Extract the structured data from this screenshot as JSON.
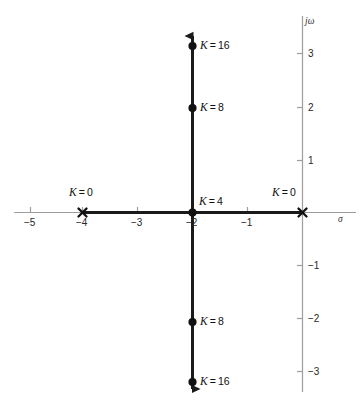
{
  "figure": {
    "type": "root-locus",
    "background": "#ffffff",
    "axis_color": "#9a9a9a",
    "locus_color": "#1a1a1a",
    "width": 364,
    "height": 420
  },
  "axes": {
    "real_axis_label": "σ",
    "imag_axis_label": "jω",
    "real_ticks": [
      "−5",
      "−4",
      "−3",
      "−2",
      "−1"
    ],
    "imag_ticks": [
      "3",
      "2",
      "1",
      "−1",
      "−2",
      "−3"
    ]
  },
  "markers": {
    "pole_left_label": "K = 0",
    "pole_origin_label": "K = 0",
    "breakaway_label": "K = 4",
    "gain8_upper_label": "K = 8",
    "gain8_lower_label": "K = 8",
    "gain16_upper_label": "K = 16",
    "gain16_lower_label": "K = 16"
  },
  "chart_data": {
    "type": "scatter",
    "title": "",
    "xlabel": "σ",
    "ylabel": "jω",
    "xlim": [
      -5.6,
      0.9
    ],
    "ylim": [
      -3.9,
      3.9
    ],
    "grid": false,
    "legend": "none",
    "annotations": [
      {
        "text": "K = 0",
        "x": -4,
        "y": 0
      },
      {
        "text": "K = 0",
        "x": 0,
        "y": 0
      },
      {
        "text": "K = 4",
        "x": -2,
        "y": 0
      },
      {
        "text": "K = 8",
        "x": -2,
        "y": 2
      },
      {
        "text": "K = 8",
        "x": -2,
        "y": -2
      },
      {
        "text": "K = 16",
        "x": -2,
        "y": 3.2
      },
      {
        "text": "K = 16",
        "x": -2,
        "y": -3.2
      }
    ],
    "series": [
      {
        "name": "open-loop poles",
        "marker": "x",
        "values": [
          {
            "x": -4,
            "y": 0
          },
          {
            "x": 0,
            "y": 0
          }
        ]
      },
      {
        "name": "gain points",
        "marker": "dot",
        "values": [
          {
            "x": -2,
            "y": 0,
            "K": 4
          },
          {
            "x": -2,
            "y": 2,
            "K": 8
          },
          {
            "x": -2,
            "y": -2,
            "K": 8
          },
          {
            "x": -2,
            "y": 3.2,
            "K": 16
          },
          {
            "x": -2,
            "y": -3.2,
            "K": 16
          }
        ]
      },
      {
        "name": "locus-real-segment",
        "marker": "line",
        "values": [
          {
            "x": -4,
            "y": 0
          },
          {
            "x": 0,
            "y": 0
          }
        ]
      },
      {
        "name": "locus-vertical-asymptote",
        "marker": "line-arrow",
        "values": [
          {
            "x": -2,
            "y": -3.8
          },
          {
            "x": -2,
            "y": 3.8
          }
        ]
      }
    ]
  }
}
